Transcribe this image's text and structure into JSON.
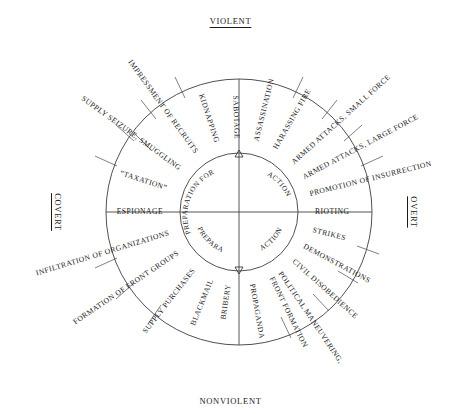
{
  "figure": {
    "type": "radial-quadrant-diagram",
    "center": {
      "x": 239,
      "y": 212
    },
    "inner_radius": 59,
    "middle_radius": 133,
    "axes": {
      "top": "VIOLENT",
      "bottom": "NONVIOLENT",
      "left": "COVERT",
      "right": "OVERT"
    },
    "inner_quadrants": [
      {
        "name": "upper-left",
        "label": "PREPARATION FOR"
      },
      {
        "name": "upper-right",
        "label": "ACTION"
      },
      {
        "name": "lower-left",
        "label": "PREPARATION FOR"
      },
      {
        "name": "lower-right",
        "label": "ACTION"
      }
    ],
    "ring_items": [
      {
        "label": "ESPIONAGE",
        "angle_deg": 180,
        "radial": false,
        "quadrant": "covert-violent"
      },
      {
        "label": "“TAXATION”",
        "angle_deg": 198,
        "radial": false,
        "quadrant": "covert-violent"
      },
      {
        "label": "SUPPLY SEIZURE, SMUGGLING",
        "angle_deg": 216,
        "radial": true,
        "quadrant": "covert-violent"
      },
      {
        "label": "IMPRESSMENT OF RECRUITS",
        "angle_deg": 234,
        "radial": true,
        "quadrant": "covert-violent"
      },
      {
        "label": "KIDNAPPING",
        "angle_deg": 252,
        "radial": true,
        "quadrant": "covert-violent"
      },
      {
        "label": "SABOTAGE",
        "angle_deg": 268,
        "radial": true,
        "quadrant": "covert-violent"
      },
      {
        "label": "ASSASSINATION",
        "angle_deg": 284,
        "radial": true,
        "quadrant": "overt-violent"
      },
      {
        "label": "HARASSING FIRE",
        "angle_deg": 300,
        "radial": true,
        "quadrant": "overt-violent"
      },
      {
        "label": "ARMED ATTACKS, SMALL FORCE",
        "angle_deg": 318,
        "radial": true,
        "quadrant": "overt-violent"
      },
      {
        "label": "ARMED ATTACKS, LARGE FORCE",
        "angle_deg": 332,
        "radial": true,
        "quadrant": "overt-violent"
      },
      {
        "label": "PROMOTION OF INSURRECTION",
        "angle_deg": 346,
        "radial": true,
        "quadrant": "overt-violent"
      },
      {
        "label": "RIOTING",
        "angle_deg": 0,
        "radial": false,
        "quadrant": "overt-nonviolent"
      },
      {
        "label": "STRIKES",
        "angle_deg": 14,
        "radial": false,
        "quadrant": "overt-nonviolent"
      },
      {
        "label": "DEMONSTRATIONS",
        "angle_deg": 28,
        "radial": true,
        "quadrant": "overt-nonviolent"
      },
      {
        "label": "CIVIL DISOBEDIENCE",
        "angle_deg": 42,
        "radial": true,
        "quadrant": "overt-nonviolent"
      },
      {
        "label": "POLITICAL MANEUVERING,",
        "angle_deg": 56,
        "radial": true,
        "quadrant": "overt-nonviolent"
      },
      {
        "label": "FRONT FORMATION",
        "angle_deg": 64,
        "radial": true,
        "quadrant": "overt-nonviolent"
      },
      {
        "label": "PROPAGANDA",
        "angle_deg": 80,
        "radial": true,
        "quadrant": "overt-nonviolent"
      },
      {
        "label": "BRIBERY",
        "angle_deg": 98,
        "radial": true,
        "quadrant": "covert-nonviolent"
      },
      {
        "label": "BLACKMAIL",
        "angle_deg": 112,
        "radial": true,
        "quadrant": "covert-nonviolent"
      },
      {
        "label": "SUPPLY PURCHASES",
        "angle_deg": 128,
        "radial": true,
        "quadrant": "covert-nonviolent"
      },
      {
        "label": "FORMATION OF FRONT GROUPS",
        "angle_deg": 146,
        "radial": true,
        "quadrant": "covert-nonviolent"
      },
      {
        "label": "INFILTRATION OF ORGANIZATIONS",
        "angle_deg": 163,
        "radial": true,
        "quadrant": "covert-nonviolent"
      }
    ],
    "colors": {
      "background": "#ffffff",
      "stroke": "#3c3c3c",
      "text": "#1a1a1a"
    }
  }
}
